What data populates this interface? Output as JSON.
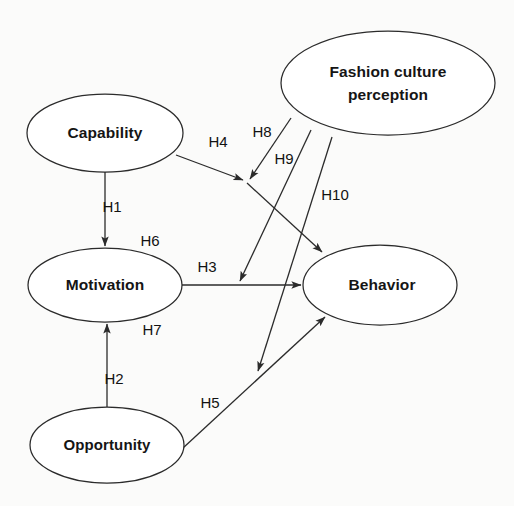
{
  "diagram": {
    "type": "path-model-diagram",
    "background_color": "#fbfbfa",
    "line_color": "#2b2b2b",
    "node_fill": "#ffffff",
    "text_color": "#151515",
    "nodes": [
      {
        "id": "capability",
        "label": "Capability",
        "cx": 105,
        "cy": 133,
        "rx": 78,
        "ry": 39
      },
      {
        "id": "fashion_culture_perception",
        "label_line1": "Fashion culture",
        "label_line2": "perception",
        "cx": 388,
        "cy": 83,
        "rx": 107,
        "ry": 52
      },
      {
        "id": "motivation",
        "label": "Motivation",
        "cx": 105,
        "cy": 285,
        "rx": 77,
        "ry": 37
      },
      {
        "id": "behavior",
        "label": "Behavior",
        "cx": 380,
        "cy": 285,
        "rx": 77,
        "ry": 40
      },
      {
        "id": "opportunity",
        "label": "Opportunity",
        "cx": 107,
        "cy": 445,
        "rx": 77,
        "ry": 38
      }
    ],
    "edges": [
      {
        "id": "h1",
        "label": "H1",
        "from": "capability",
        "to": "motivation",
        "label_x": 112,
        "label_y": 208
      },
      {
        "id": "h2",
        "label": "H2",
        "from": "opportunity",
        "to": "motivation",
        "label_x": 114,
        "label_y": 380
      },
      {
        "id": "h3",
        "label": "H3",
        "from": "motivation",
        "to": "behavior",
        "label_x": 207,
        "label_y": 268
      },
      {
        "id": "h4",
        "label": "H4",
        "from": "capability",
        "to": "behavior",
        "label_x": 218,
        "label_y": 143
      },
      {
        "id": "h5",
        "label": "H5",
        "from": "opportunity",
        "to": "behavior",
        "label_x": 210,
        "label_y": 404
      },
      {
        "id": "h6",
        "label": "H6",
        "from": "fashion_culture_perception",
        "to": "h1_path",
        "label_x": 150,
        "label_y": 242
      },
      {
        "id": "h7",
        "label": "H7",
        "from": "fashion_culture_perception",
        "to": "h2_path",
        "label_x": 152,
        "label_y": 331
      },
      {
        "id": "h8",
        "label": "H8",
        "from": "fashion_culture_perception",
        "to": "h4_path",
        "label_x": 262,
        "label_y": 133
      },
      {
        "id": "h9",
        "label": "H9",
        "from": "fashion_culture_perception",
        "to": "h3_path",
        "label_x": 284,
        "label_y": 160
      },
      {
        "id": "h10",
        "label": "H10",
        "from": "fashion_culture_perception",
        "to": "h5_path",
        "label_x": 335,
        "label_y": 196
      }
    ]
  }
}
